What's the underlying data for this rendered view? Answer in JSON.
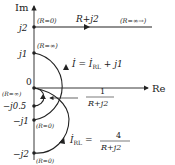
{
  "axes": {
    "im_label": "Im",
    "re_label": "Re",
    "ticks": {
      "j2": "j2",
      "j1": "j1",
      "zero": "0",
      "mj05": "−j0.5",
      "mj1": "−j1",
      "mj2": "−j2"
    }
  },
  "annotations": {
    "r0_top": "(R=0)",
    "r_inf_right": "(R=∞→)",
    "r_plus_j2": "R+j2",
    "r_inf_j1": "(R=∞)",
    "r_inf_origin": "(R=∞)",
    "r0_mj1": "(R=0)",
    "r0_mj2": "(R=0)",
    "i_eq_lhs": "İ = İ",
    "i_eq_sub": "RL",
    "i_eq_rhs": " + j1",
    "inv_num": "1",
    "inv_den": "R+j2",
    "irl_lhs": "İ",
    "irl_sub": "RL",
    "irl_eq": " = ",
    "irl_num": "4",
    "irl_den": "R+j2"
  }
}
